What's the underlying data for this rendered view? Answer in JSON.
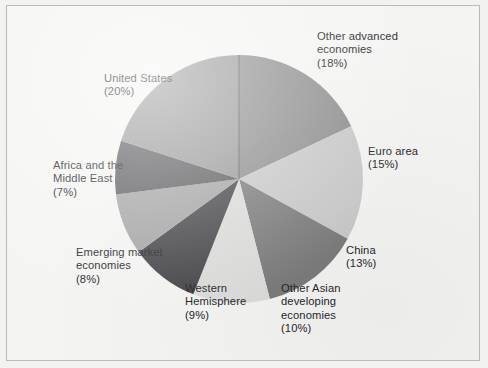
{
  "figure": {
    "background_color": "#f4f4f2",
    "border_color": "#b9b9b6",
    "text_color": "#26262a"
  },
  "chart_data": {
    "type": "pie",
    "title": "",
    "subtitle": "",
    "xlabel": "",
    "ylabel": "",
    "units": "percent",
    "legend_position": "outside-labels",
    "grid": false,
    "start_angle_deg": 0,
    "direction": "clockwise",
    "categories": [
      "Other advanced economies",
      "Euro area",
      "China",
      "Other Asian developing economies",
      "Western Hemisphere",
      "Emerging market economies",
      "Africa and the Middle East",
      "United States"
    ],
    "values": [
      18,
      15,
      13,
      10,
      9,
      8,
      7,
      20
    ],
    "colors": [
      "#8e8e8e",
      "#c9c9c9",
      "#7b7b7b",
      "#dcdcda",
      "#454549",
      "#a4a4a4",
      "#5c5c60",
      "#999999"
    ],
    "slices": [
      {
        "name": "Other advanced economies",
        "value": 18,
        "label_lines": [
          "Other advanced",
          "economies",
          "(18%)"
        ],
        "label_text": "Other advanced economies (18%)",
        "percent_text": "(18%)",
        "color": "#8e8e8e"
      },
      {
        "name": "Euro area",
        "value": 15,
        "label_lines": [
          "Euro area",
          "(15%)"
        ],
        "label_text": "Euro area (15%)",
        "percent_text": "(15%)",
        "color": "#c9c9c9"
      },
      {
        "name": "China",
        "value": 13,
        "label_lines": [
          "China",
          "(13%)"
        ],
        "label_text": "China (13%)",
        "percent_text": "(13%)",
        "color": "#7b7b7b"
      },
      {
        "name": "Other Asian developing economies",
        "value": 10,
        "label_lines": [
          "Other Asian",
          "developing",
          "economies",
          "(10%)"
        ],
        "label_text": "Other Asian developing economies (10%)",
        "percent_text": "(10%)",
        "color": "#dcdcda"
      },
      {
        "name": "Western Hemisphere",
        "value": 9,
        "label_lines": [
          "Western",
          "Hemisphere",
          "(9%)"
        ],
        "label_text": "Western Hemisphere (9%)",
        "percent_text": "(9%)",
        "color": "#454549"
      },
      {
        "name": "Emerging market economies",
        "value": 8,
        "label_lines": [
          "Emerging market",
          "economies",
          "(8%)"
        ],
        "label_text": "Emerging market economies (8%)",
        "percent_text": "(8%)",
        "color": "#a4a4a4"
      },
      {
        "name": "Africa and the Middle East",
        "value": 7,
        "label_lines": [
          "Africa and the",
          "Middle East",
          "(7%)"
        ],
        "label_text": "Africa and the Middle East (7%)",
        "percent_text": "(7%)",
        "color": "#5c5c60"
      },
      {
        "name": "United States",
        "value": 20,
        "label_lines": [
          "United States",
          "(20%)"
        ],
        "label_text": "United States (20%)",
        "percent_text": "(20%)",
        "color": "#999999"
      }
    ]
  },
  "labels": {
    "other_advanced": "Other advanced\neconomies\n(18%)",
    "euro_area": "Euro area\n(15%)",
    "china": "China\n(13%)",
    "other_asian": "Other Asian\ndeveloping\neconomies\n(10%)",
    "western_hemisphere": "Western\nHemisphere\n(9%)",
    "emerging_market": "Emerging market\neconomies\n(8%)",
    "africa_middle_east": "Africa and the\nMiddle East\n(7%)",
    "united_states": "United States\n(20%)"
  }
}
